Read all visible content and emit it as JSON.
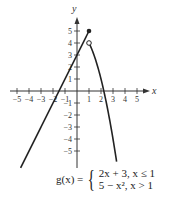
{
  "chart_data": {
    "type": "line",
    "title": "",
    "xlabel": "x",
    "ylabel": "y",
    "xlim": [
      -6,
      6
    ],
    "ylim": [
      -6,
      6
    ],
    "x_ticks": [
      -5,
      -4,
      -3,
      -2,
      -1,
      1,
      2,
      3,
      4,
      5
    ],
    "y_ticks": [
      -5,
      -4,
      -3,
      -2,
      -1,
      1,
      2,
      3,
      4,
      5
    ],
    "x_tick_labels": [
      "-5",
      "-4",
      "-3",
      "-2",
      "-1",
      "1",
      "2",
      "3",
      "4",
      "5"
    ],
    "y_tick_labels": [
      "-5",
      "-4",
      "-3",
      "-2",
      "-1",
      "1",
      "2",
      "3",
      "4",
      "5"
    ],
    "grid": false,
    "series": [
      {
        "name": "2x + 3, x ≤ 1",
        "x": [
          -4.7,
          1
        ],
        "y": [
          -6.4,
          5
        ],
        "endpoint": "closed"
      },
      {
        "name": "5 - x², x > 1",
        "x": [
          1,
          1.5,
          2,
          2.236,
          2.5,
          3.3
        ],
        "y": [
          4,
          2.75,
          1,
          0,
          -1.25,
          -5.9
        ],
        "endpoint": "open"
      }
    ],
    "points": [
      {
        "x": 1,
        "y": 5,
        "style": "closed"
      },
      {
        "x": 1,
        "y": 4,
        "style": "open"
      }
    ],
    "annotations": [
      "g(x) = { 2x + 3, x ≤ 1 ; 5 − x², x > 1"
    ]
  },
  "equation": {
    "lhs": "g(x) =",
    "case1": "2x + 3, x ≤ 1",
    "case2": "5 − x², x > 1"
  },
  "axes": {
    "x_label": "x",
    "y_label": "y"
  }
}
